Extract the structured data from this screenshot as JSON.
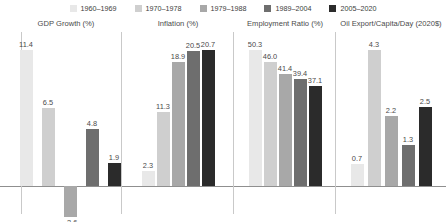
{
  "legend": {
    "items": [
      {
        "label": "1960–1969",
        "color": "#e8e8e8"
      },
      {
        "label": "1970–1978",
        "color": "#cfcfcf"
      },
      {
        "label": "1979–1988",
        "color": "#a8a8a8"
      },
      {
        "label": "1989–2004",
        "color": "#6e6e6e"
      },
      {
        "label": "2005–2020",
        "color": "#2b2b2b"
      }
    ]
  },
  "chart_data": {
    "type": "bar",
    "title": "",
    "categories": [
      "1960–1969",
      "1970–1978",
      "1979–1988",
      "1989–2004",
      "2005–2020"
    ],
    "grid": false,
    "legend_position": "top",
    "panels": [
      {
        "title": "GDP Growth (%)",
        "ylabel": "",
        "xlabel": "",
        "ylim": [
          -2.6,
          11.4
        ],
        "values": [
          11.4,
          6.5,
          -2.6,
          4.8,
          1.9
        ],
        "labels": [
          "11.4",
          "6.5",
          "−2.6",
          "4.8",
          "1.9"
        ]
      },
      {
        "title": "Inflation (%)",
        "ylabel": "",
        "xlabel": "",
        "ylim": [
          0,
          20.7
        ],
        "values": [
          2.3,
          11.3,
          18.9,
          20.5,
          20.7
        ],
        "labels": [
          "2.3",
          "11.3",
          "18.9",
          "20.5",
          "20.7"
        ]
      },
      {
        "title": "Employment Ratio (%)",
        "ylabel": "",
        "xlabel": "",
        "ylim": [
          0,
          50.3
        ],
        "values": [
          50.3,
          46.0,
          41.4,
          39.4,
          37.1
        ],
        "labels": [
          "50.3",
          "46.0",
          "41.4",
          "39.4",
          "37.1"
        ]
      },
      {
        "title": "Oil Export/Capita/Day (2020$)",
        "ylabel": "",
        "xlabel": "",
        "ylim": [
          0,
          4.3
        ],
        "values": [
          0.7,
          4.3,
          2.2,
          1.3,
          2.5
        ],
        "labels": [
          "0.7",
          "4.3",
          "2.2",
          "1.3",
          "2.5"
        ]
      }
    ]
  }
}
